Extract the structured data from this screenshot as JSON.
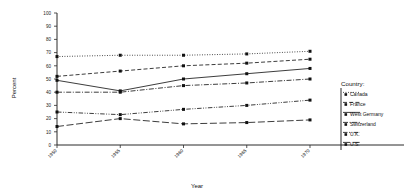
{
  "chart_data": {
    "type": "line",
    "title": "",
    "xlabel": "Year",
    "ylabel": "Percent",
    "x": [
      1950,
      1955,
      1960,
      1965,
      1970
    ],
    "xtick_labels": [
      "1950",
      "1955",
      "1960",
      "1965",
      "1970"
    ],
    "ytick_labels": [
      "0",
      "10",
      "20",
      "30",
      "40",
      "50",
      "60",
      "70",
      "80",
      "90",
      "100"
    ],
    "ytick_values": [
      0,
      10,
      20,
      30,
      40,
      50,
      60,
      70,
      80,
      90,
      100
    ],
    "ylim": [
      0,
      100
    ],
    "xlim": [
      1950,
      1970
    ],
    "grid": false,
    "legend_position": "right",
    "legend_title": "Country:",
    "series": [
      {
        "name": "Canada",
        "marker": "square",
        "linestyle": "dotted",
        "values": [
          67,
          68,
          68,
          69,
          71
        ]
      },
      {
        "name": "France",
        "marker": "square",
        "linestyle": "dashed",
        "values": [
          52,
          56,
          60,
          62,
          65
        ]
      },
      {
        "name": "West Germany",
        "marker": "square",
        "linestyle": "solid",
        "values": [
          49,
          41,
          50,
          54,
          58
        ]
      },
      {
        "name": "Switzerland",
        "marker": "square",
        "linestyle": "dashdot",
        "values": [
          40,
          40,
          45,
          47,
          50
        ]
      },
      {
        "name": "U.K.",
        "marker": "square",
        "linestyle": "dashdot2",
        "values": [
          25,
          23,
          27,
          30,
          34
        ]
      },
      {
        "name": "U.S.",
        "marker": "square",
        "linestyle": "longdash",
        "values": [
          14,
          20,
          16,
          17,
          19
        ]
      }
    ]
  },
  "axes": {
    "ylabel": "Percent",
    "xlabel": "Year"
  },
  "legend": {
    "title": "Country:",
    "items": [
      {
        "label": "Canada"
      },
      {
        "label": "France"
      },
      {
        "label": "West Germany"
      },
      {
        "label": "Switzerland"
      },
      {
        "label": "U.K."
      },
      {
        "label": "U.S."
      }
    ]
  }
}
